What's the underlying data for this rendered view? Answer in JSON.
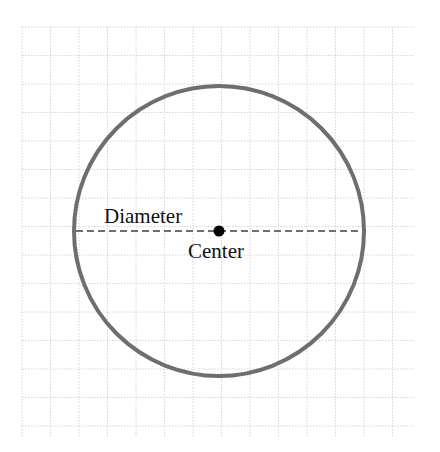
{
  "diagram": {
    "type": "circle-diagram",
    "labels": {
      "diameter": "Diameter",
      "center": "Center"
    },
    "colors": {
      "circle": "#6e6e6e",
      "diameter_line": "#6e6e6e",
      "center_dot": "#000000",
      "grid": "#d4d4d4"
    },
    "grid": {
      "x0": 22,
      "y0": 27,
      "x1": 415,
      "y1": 438,
      "spacing": 28.5
    },
    "circle": {
      "cx": 219,
      "cy": 231,
      "r": 145
    }
  }
}
